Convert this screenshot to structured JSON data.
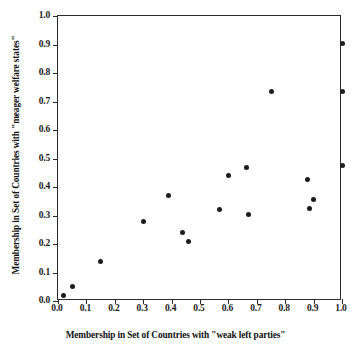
{
  "chart_data": {
    "type": "scatter",
    "title": "",
    "xlabel": "Membership in Set of Countries with \"weak left parties\"",
    "ylabel": "Membership in Set of Countries with \"meager welfare states\"",
    "xlim": [
      0.0,
      1.0
    ],
    "ylim": [
      0.0,
      1.0
    ],
    "grid": false,
    "legend": null,
    "xticks": [
      "0.0",
      "0.1",
      "0.2",
      "0.3",
      "0.4",
      "0.5",
      "0.6",
      "0.7",
      "0.8",
      "0.9",
      "1.0"
    ],
    "xtick_values": [
      0.0,
      0.1,
      0.2,
      0.3,
      0.4,
      0.5,
      0.6,
      0.7,
      0.8,
      0.9,
      1.0
    ],
    "yticks": [
      "0.0",
      "0.1",
      "0.2",
      "0.3",
      "0.4",
      "0.5",
      "0.6",
      "0.7",
      "0.8",
      "0.9",
      "1.0"
    ],
    "ytick_values": [
      0.0,
      0.1,
      0.2,
      0.3,
      0.4,
      0.5,
      0.6,
      0.7,
      0.8,
      0.9,
      1.0
    ],
    "marker": "filled-circle",
    "marker_color": "#1c1c1c",
    "points": [
      {
        "x": 0.02,
        "y": 0.02
      },
      {
        "x": 0.05,
        "y": 0.05
      },
      {
        "x": 0.15,
        "y": 0.14
      },
      {
        "x": 0.3,
        "y": 0.28
      },
      {
        "x": 0.39,
        "y": 0.37
      },
      {
        "x": 0.44,
        "y": 0.24
      },
      {
        "x": 0.46,
        "y": 0.21
      },
      {
        "x": 0.57,
        "y": 0.32
      },
      {
        "x": 0.6,
        "y": 0.44
      },
      {
        "x": 0.665,
        "y": 0.47
      },
      {
        "x": 0.67,
        "y": 0.305
      },
      {
        "x": 0.75,
        "y": 0.735
      },
      {
        "x": 0.88,
        "y": 0.425
      },
      {
        "x": 0.885,
        "y": 0.325
      },
      {
        "x": 0.9,
        "y": 0.355
      },
      {
        "x": 1.0,
        "y": 0.905
      },
      {
        "x": 1.0,
        "y": 0.735
      },
      {
        "x": 1.0,
        "y": 0.475
      }
    ]
  }
}
